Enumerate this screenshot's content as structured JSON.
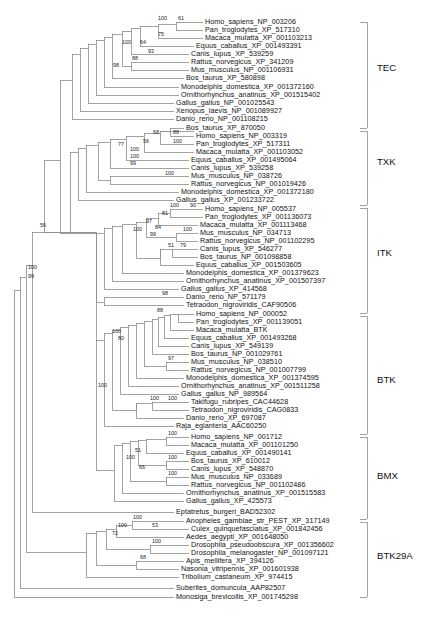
{
  "figure": {
    "type": "phylogenetic-tree",
    "title": "",
    "orientation": "left-to-right rectangular cladogram",
    "branch_color": "#8c8c8c",
    "text_color": "#111111"
  },
  "clade_labels": [
    {
      "name": "TEC",
      "label": "TEC",
      "top": 22,
      "bottom": 128,
      "text_y": 68
    },
    {
      "name": "TXK",
      "label": "TXK",
      "top": 131,
      "bottom": 205,
      "text_y": 162
    },
    {
      "name": "ITK",
      "label": "ITK",
      "top": 208,
      "bottom": 313,
      "text_y": 253
    },
    {
      "name": "BTK",
      "label": "BTK",
      "top": 316,
      "bottom": 434,
      "text_y": 380
    },
    {
      "name": "BMX",
      "label": "BMX",
      "top": 437,
      "bottom": 519,
      "text_y": 476
    },
    {
      "name": "BTK29A",
      "label": "BTK29A",
      "top": 522,
      "bottom": 597,
      "text_y": 556
    }
  ],
  "taxa": [
    {
      "label": "Homo_sapiens_NP_003206",
      "y": 22,
      "x": 205
    },
    {
      "label": "Pan_troglodytes_XP_517310",
      "y": 30,
      "x": 205
    },
    {
      "label": "Macaca_mulatta_XP_001103213",
      "y": 38,
      "x": 205
    },
    {
      "label": "Equus_caballus_XP_001493391",
      "y": 46,
      "x": 196
    },
    {
      "label": "Canis_lupus_XP_539259",
      "y": 54,
      "x": 191
    },
    {
      "label": "Rattus_norvegicus_XP_341209",
      "y": 62,
      "x": 191
    },
    {
      "label": "Mus_musculus_NP_001106931",
      "y": 70,
      "x": 191
    },
    {
      "label": "Bos_taurus_XP_580898",
      "y": 78,
      "x": 186
    },
    {
      "label": "Monodelphis_domestica_XP_001372160",
      "y": 87,
      "x": 181
    },
    {
      "label": "Ornithorhynchus_anatinus_XP_001515402",
      "y": 95,
      "x": 181
    },
    {
      "label": "Gallus_gallus_NP_001025543",
      "y": 103,
      "x": 176
    },
    {
      "label": "Xenopus_laevis_NP_001089927",
      "y": 111,
      "x": 176
    },
    {
      "label": "Danio_rerio_NP_001108215",
      "y": 119,
      "x": 176
    },
    {
      "label": "Bos_taurus_XP_870050",
      "y": 128,
      "x": 186
    },
    {
      "label": "Homo_sapiens_NP_003319",
      "y": 136,
      "x": 196
    },
    {
      "label": "Pan_troglodytes_XP_517311",
      "y": 144,
      "x": 196
    },
    {
      "label": "Macaca_mulatta_XP_001103052",
      "y": 152,
      "x": 196
    },
    {
      "label": "Equus_caballus_XP_001495064",
      "y": 160,
      "x": 191
    },
    {
      "label": "Canis_lupus_XP_539258",
      "y": 168,
      "x": 191
    },
    {
      "label": "Mus_musculus_NP_038726",
      "y": 176,
      "x": 191
    },
    {
      "label": "Rattus_norvegicus_NP_001019426",
      "y": 184,
      "x": 191
    },
    {
      "label": "Monodelphis_domestica_XP_001372180",
      "y": 192,
      "x": 181
    },
    {
      "label": "Gallus_gallus_XP_001233722",
      "y": 200,
      "x": 176
    },
    {
      "label": "Homo_sapiens_NP_005537",
      "y": 209,
      "x": 205
    },
    {
      "label": "Pan_troglodytes_XP_001136073",
      "y": 217,
      "x": 205
    },
    {
      "label": "Macaca_mulatta_XP_001113468",
      "y": 225,
      "x": 200
    },
    {
      "label": "Mus_musculus_NP_034713",
      "y": 233,
      "x": 200
    },
    {
      "label": "Rattus_norvegicus_NP_001102295",
      "y": 241,
      "x": 200
    },
    {
      "label": "Canis_lupus_XP_546277",
      "y": 249,
      "x": 200
    },
    {
      "label": "Bos_taurus_NP_001098858",
      "y": 257,
      "x": 200
    },
    {
      "label": "Equus_caballus_XP_001503605",
      "y": 265,
      "x": 196
    },
    {
      "label": "Monodelphis_domestica_XP_001379623",
      "y": 273,
      "x": 186
    },
    {
      "label": "Ornithorhynchus_anatinus_XP_001507397",
      "y": 281,
      "x": 186
    },
    {
      "label": "Gallus_gallus_XP_414568",
      "y": 289,
      "x": 181
    },
    {
      "label": "Danio_rerio_NP_571179",
      "y": 297,
      "x": 186
    },
    {
      "label": "Tetraodon_nigroviridis_CAF90506",
      "y": 305,
      "x": 186
    },
    {
      "label": "Homo_sapiens_NP_000052",
      "y": 314,
      "x": 196
    },
    {
      "label": "Pan_troglodytes_XP_001139051",
      "y": 322,
      "x": 196
    },
    {
      "label": "Macaca_mulatta_BTK",
      "y": 330,
      "x": 196
    },
    {
      "label": "Equus_caballus_XP_001493268",
      "y": 338,
      "x": 191
    },
    {
      "label": "Canis_lupus_XP_549139",
      "y": 346,
      "x": 191
    },
    {
      "label": "Bos_taurus_NP_001029761",
      "y": 354,
      "x": 191
    },
    {
      "label": "Mus_musculus_NP_038510",
      "y": 362,
      "x": 191
    },
    {
      "label": "Rattus_norvegicus_NP_001007799",
      "y": 370,
      "x": 191
    },
    {
      "label": "Monodelphis_domestica_XP_001374595",
      "y": 378,
      "x": 186
    },
    {
      "label": "Ornithorhynchus_anatinus_XP_001511258",
      "y": 386,
      "x": 181
    },
    {
      "label": "Gallus_gallus_NP_989564",
      "y": 394,
      "x": 181
    },
    {
      "label": "Takifugu_rubripes_CAC44628",
      "y": 402,
      "x": 191
    },
    {
      "label": "Tetraodon_nigroviridis_CAG0833",
      "y": 410,
      "x": 191
    },
    {
      "label": "Danio_rerio_XP_697087",
      "y": 418,
      "x": 186
    },
    {
      "label": "Raja_eglanteria_AAC60250",
      "y": 426,
      "x": 176
    },
    {
      "label": "Homo_sapiens_NP_001712",
      "y": 437,
      "x": 191
    },
    {
      "label": "Macaca_mulatta_XP_001101250",
      "y": 445,
      "x": 191
    },
    {
      "label": "Equus_caballus_XP_001490141",
      "y": 453,
      "x": 186
    },
    {
      "label": "Bos_taurus_XP_610012",
      "y": 461,
      "x": 191
    },
    {
      "label": "Canis_lupus_XP_548870",
      "y": 469,
      "x": 191
    },
    {
      "label": "Mus_musculus_NP_033689",
      "y": 477,
      "x": 191
    },
    {
      "label": "Rattus_norvegicus_NP_001102486",
      "y": 485,
      "x": 191
    },
    {
      "label": "Ornithorhynchus_anatinus_XP_001515583",
      "y": 493,
      "x": 186
    },
    {
      "label": "Gallus_gallus_XP_425573",
      "y": 501,
      "x": 186
    },
    {
      "label": "Eptatretus_burgeri_BAD52302",
      "y": 512,
      "x": 176
    },
    {
      "label": "Anopheles_gambiae_str_PEST_XP_317149",
      "y": 521,
      "x": 186
    },
    {
      "label": "Culex_quinquefasciatus_XP_001842456",
      "y": 529,
      "x": 191
    },
    {
      "label": "Aedes_aegypti_XP_001648050",
      "y": 537,
      "x": 186
    },
    {
      "label": "Drosophila_pseudoobscura_XP_001356602",
      "y": 545,
      "x": 191
    },
    {
      "label": "Drosophila_melanogaster_NP_001097121",
      "y": 553,
      "x": 191
    },
    {
      "label": "Apis_mellifera_XP_394126",
      "y": 561,
      "x": 186
    },
    {
      "label": "Nasonia_vitripennis_XP_001601938",
      "y": 569,
      "x": 181
    },
    {
      "label": "Tribolium_castaneum_XP_974415",
      "y": 577,
      "x": 181
    },
    {
      "label": "Suberites_domuncula_AAP82507",
      "y": 588,
      "x": 176
    },
    {
      "label": "Monosiga_brevicollis_XP_001745298",
      "y": 597,
      "x": 176
    }
  ],
  "bootstrap_values": [
    {
      "value": "100",
      "x": 158,
      "y": 19
    },
    {
      "value": "61",
      "x": 178,
      "y": 19
    },
    {
      "value": "75",
      "x": 158,
      "y": 35
    },
    {
      "value": "64",
      "x": 140,
      "y": 43
    },
    {
      "value": "100",
      "x": 122,
      "y": 43
    },
    {
      "value": "93",
      "x": 148,
      "y": 52
    },
    {
      "value": "88",
      "x": 132,
      "y": 59
    },
    {
      "value": "98",
      "x": 113,
      "y": 66
    },
    {
      "value": "77",
      "x": 118,
      "y": 145
    },
    {
      "value": "68",
      "x": 153,
      "y": 133
    },
    {
      "value": "88",
      "x": 173,
      "y": 133
    },
    {
      "value": "100",
      "x": 173,
      "y": 142
    },
    {
      "value": "56",
      "x": 143,
      "y": 142
    },
    {
      "value": "100",
      "x": 130,
      "y": 150
    },
    {
      "value": "100",
      "x": 130,
      "y": 157
    },
    {
      "value": "99",
      "x": 130,
      "y": 164
    },
    {
      "value": "100",
      "x": 165,
      "y": 174
    },
    {
      "value": "100",
      "x": 170,
      "y": 206
    },
    {
      "value": "90",
      "x": 190,
      "y": 206
    },
    {
      "value": "81",
      "x": 162,
      "y": 214
    },
    {
      "value": "97",
      "x": 146,
      "y": 222
    },
    {
      "value": "84",
      "x": 155,
      "y": 228
    },
    {
      "value": "100",
      "x": 183,
      "y": 230
    },
    {
      "value": "99",
      "x": 150,
      "y": 235
    },
    {
      "value": "100",
      "x": 133,
      "y": 230
    },
    {
      "value": "51",
      "x": 168,
      "y": 246
    },
    {
      "value": "79",
      "x": 180,
      "y": 246
    },
    {
      "value": "56",
      "x": 40,
      "y": 226
    },
    {
      "value": "98",
      "x": 162,
      "y": 294
    },
    {
      "value": "88",
      "x": 157,
      "y": 311
    },
    {
      "value": "100",
      "x": 112,
      "y": 332
    },
    {
      "value": "80",
      "x": 118,
      "y": 339
    },
    {
      "value": "97",
      "x": 168,
      "y": 359
    },
    {
      "value": "100",
      "x": 150,
      "y": 399
    },
    {
      "value": "100",
      "x": 168,
      "y": 399
    },
    {
      "value": "100",
      "x": 28,
      "y": 268
    },
    {
      "value": "99",
      "x": 28,
      "y": 277
    },
    {
      "value": "100",
      "x": 98,
      "y": 386
    },
    {
      "value": "100",
      "x": 168,
      "y": 434
    },
    {
      "value": "51",
      "x": 135,
      "y": 451
    },
    {
      "value": "100",
      "x": 126,
      "y": 458
    },
    {
      "value": "100",
      "x": 168,
      "y": 458
    },
    {
      "value": "66",
      "x": 139,
      "y": 468
    },
    {
      "value": "100",
      "x": 168,
      "y": 474
    },
    {
      "value": "100",
      "x": 133,
      "y": 518
    },
    {
      "value": "100",
      "x": 118,
      "y": 526
    },
    {
      "value": "53",
      "x": 152,
      "y": 526
    },
    {
      "value": "72",
      "x": 112,
      "y": 534
    },
    {
      "value": "100",
      "x": 152,
      "y": 542
    },
    {
      "value": "68",
      "x": 140,
      "y": 558
    }
  ]
}
